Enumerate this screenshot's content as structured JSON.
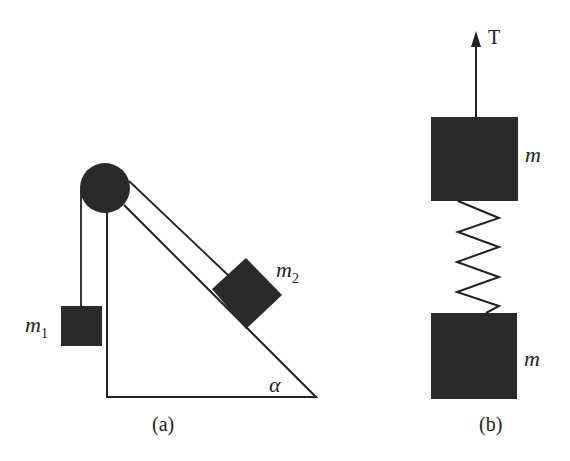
{
  "figure": {
    "colors": {
      "ink": "#222222",
      "block_fill": "#2a2a2a",
      "background": "#ffffff"
    },
    "panel_a": {
      "caption": "(a)",
      "mass_1": {
        "symbol": "m",
        "subscript": "1"
      },
      "mass_2": {
        "symbol": "m",
        "subscript": "2"
      },
      "angle_label": "α",
      "components": [
        "pulley",
        "inclined plane",
        "string",
        "hanging block m1",
        "block m2 on incline"
      ]
    },
    "panel_b": {
      "caption": "(b)",
      "force_label": "T",
      "upper_mass_label": "m",
      "lower_mass_label": "m",
      "components": [
        "force arrow T",
        "upper block m",
        "spring",
        "lower block m"
      ]
    }
  }
}
